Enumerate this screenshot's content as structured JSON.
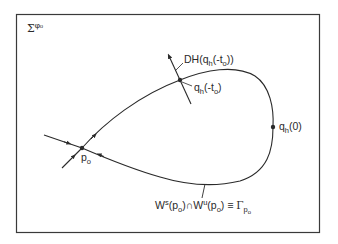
{
  "diagram": {
    "section_label": {
      "symbol": "Σ",
      "superscript": "φ₀"
    },
    "labels": {
      "dh_vector": {
        "main": "DH(q",
        "sub": "h",
        "rest": "(-t",
        "rest_sub": "o",
        "close": "))"
      },
      "q_minus_t0": {
        "main": "q",
        "sub": "h",
        "rest": "(-t",
        "rest_sub": "o",
        "close": ")"
      },
      "q_zero": {
        "main": "q",
        "sub": "h",
        "rest": "(0)"
      },
      "p0": {
        "main": "p",
        "sub": "o"
      },
      "homoclinic": {
        "ws": "W",
        "ws_sup": "s",
        "ws_arg_open": "(p",
        "ws_arg_sub": "o",
        "ws_arg_close": ")",
        "cap": "∩",
        "wu": "W",
        "wu_sup": "u",
        "wu_arg_open": "(p",
        "wu_arg_sub": "o",
        "wu_arg_close": ")",
        "equiv": " ≡ ",
        "gamma": "Γ",
        "gamma_sub": "p",
        "gamma_subsub": "o"
      }
    },
    "colors": {
      "line": "#2a2a2a",
      "frame": "#3a3a3a",
      "background": "#ffffff"
    }
  }
}
